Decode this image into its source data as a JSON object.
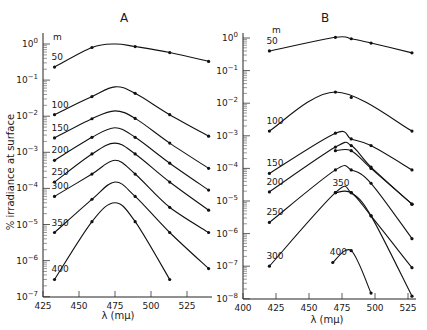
{
  "figure": {
    "ylabel": "% irradiance at surface",
    "xlabel": "λ (mμ)"
  },
  "chart_data": [
    {
      "type": "line",
      "title": "A",
      "xlabel": "λ (mμ)",
      "ylabel": "% irradiance at surface",
      "yscale": "log",
      "xlim": [
        425,
        540
      ],
      "ylim": [
        1e-07,
        1
      ],
      "x_ticks": [
        425,
        450,
        475,
        500,
        525
      ],
      "y_ticks": [
        "10^0",
        "10^-1",
        "10^-2",
        "10^-3",
        "10^-4",
        "10^-5",
        "10^-6",
        "10^-7"
      ],
      "legend_title": "m",
      "grid": false,
      "series": [
        {
          "name": "50",
          "x": [
            433,
            459,
            489,
            513,
            540
          ],
          "y": [
            0.23,
            0.8,
            0.85,
            0.58,
            0.33
          ],
          "peak": [
            475,
            1.0
          ]
        },
        {
          "name": "100",
          "x": [
            433,
            459,
            489,
            513,
            540
          ],
          "y": [
            0.011,
            0.035,
            0.043,
            0.011,
            0.0028
          ],
          "peak": [
            475,
            0.065
          ]
        },
        {
          "name": "150",
          "x": [
            433,
            459,
            489,
            513,
            540
          ],
          "y": [
            0.0025,
            0.0085,
            0.0087,
            0.0018,
            0.00036
          ],
          "peak": [
            475,
            0.014
          ]
        },
        {
          "name": "200",
          "x": [
            433,
            459,
            489,
            513,
            540
          ],
          "y": [
            0.0006,
            0.0026,
            0.0026,
            0.0005,
            9e-05
          ],
          "peak": [
            475,
            0.0048
          ]
        },
        {
          "name": "250",
          "x": [
            433,
            459,
            489,
            513,
            540
          ],
          "y": [
            0.00015,
            0.0009,
            0.0009,
            0.00015,
            2.5e-05
          ],
          "peak": [
            475,
            0.0018
          ]
        },
        {
          "name": "300",
          "x": [
            433,
            459,
            489,
            513,
            540
          ],
          "y": [
            6e-05,
            0.00025,
            0.00025,
            3e-05,
            6e-06
          ],
          "peak": [
            475,
            0.0006
          ]
        },
        {
          "name": "350",
          "x": [
            433,
            459,
            489,
            513,
            540
          ],
          "y": [
            6e-06,
            5e-05,
            6e-05,
            6e-06,
            6e-07
          ],
          "peak": [
            475,
            0.00015
          ]
        },
        {
          "name": "400",
          "x": [
            433,
            459,
            489,
            513
          ],
          "y": [
            3e-07,
            1.2e-05,
            1.2e-05,
            3e-07
          ],
          "peak": [
            475,
            4e-05
          ]
        }
      ]
    },
    {
      "type": "line",
      "title": "B",
      "xlabel": "λ (mμ)",
      "ylabel": "% irradiance at surface",
      "yscale": "log",
      "xlim": [
        400,
        530
      ],
      "ylim": [
        1e-08,
        1
      ],
      "x_ticks": [
        400,
        425,
        450,
        475,
        500,
        525
      ],
      "y_ticks": [
        "10^0",
        "10^-1",
        "10^-2",
        "10^-3",
        "10^-4",
        "10^-5",
        "10^-6",
        "10^-7",
        "10^-8"
      ],
      "legend_title": "m",
      "grid": false,
      "series": [
        {
          "name": "50",
          "x": [
            420,
            470,
            482,
            497,
            528
          ],
          "y": [
            0.4,
            1.05,
            0.95,
            0.7,
            0.35
          ]
        },
        {
          "name": "100",
          "x": [
            420,
            470,
            482,
            528
          ],
          "y": [
            0.0014,
            0.022,
            0.015,
            0.0014
          ],
          "outlier": [
            482,
            0.015
          ]
        },
        {
          "name": "150",
          "x": [
            420,
            470,
            482,
            497,
            528
          ],
          "y": [
            7e-05,
            0.0012,
            0.0008,
            0.0005,
            9e-05
          ]
        },
        {
          "name": "150b",
          "x": [
            470,
            482,
            497,
            528
          ],
          "y": [
            0.00035,
            0.00035,
            0.0001,
            8e-06
          ]
        },
        {
          "name": "200",
          "x": [
            420,
            470,
            482,
            497,
            528
          ],
          "y": [
            1.9e-05,
            0.00045,
            0.0005,
            0.00011,
            8e-06
          ]
        },
        {
          "name": "250",
          "x": [
            420,
            470,
            482,
            497,
            528
          ],
          "y": [
            2.2e-06,
            9e-05,
            9e-05,
            3.5e-05,
            7e-07
          ]
        },
        {
          "name": "300",
          "x": [
            420,
            470,
            482,
            497,
            528
          ],
          "y": [
            1e-07,
            1.8e-05,
            1.8e-05,
            3.5e-06,
            9e-08
          ]
        },
        {
          "name": "350",
          "x": [
            470,
            482,
            497,
            528
          ],
          "y": [
            1.8e-05,
            1.8e-05,
            3.5e-06,
            1.2e-08
          ]
        },
        {
          "name": "400",
          "x": [
            468,
            482,
            497
          ],
          "y": [
            1.3e-07,
            3e-07,
            1.5e-08
          ]
        }
      ]
    }
  ]
}
